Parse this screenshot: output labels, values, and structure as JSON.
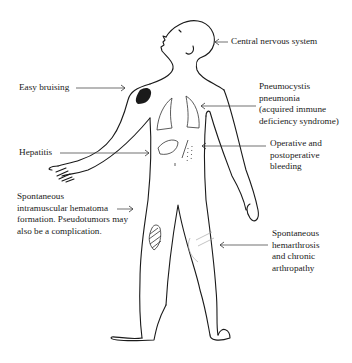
{
  "figure": {
    "labels": {
      "cns": [
        "Central nervous system"
      ],
      "bruising": [
        "Easy bruising"
      ],
      "pneumocystis": [
        "Pneumocystis",
        "pneumonia",
        "(acquired immune",
        "deficiency syndrome)"
      ],
      "hepatitis": [
        "Hepatitis"
      ],
      "operative": [
        "Operative and",
        "postoperative",
        "bleeding"
      ],
      "hematoma": [
        "Spontaneous",
        "intramuscular hematoma",
        "formation. Pseudotumors may",
        "also be a complication."
      ],
      "hemarthrosis": [
        "Spontaneous",
        "hemarthrosis",
        "and chronic",
        "arthropathy"
      ]
    },
    "colors": {
      "ink": "#1a1a1a",
      "background": "#ffffff"
    }
  }
}
